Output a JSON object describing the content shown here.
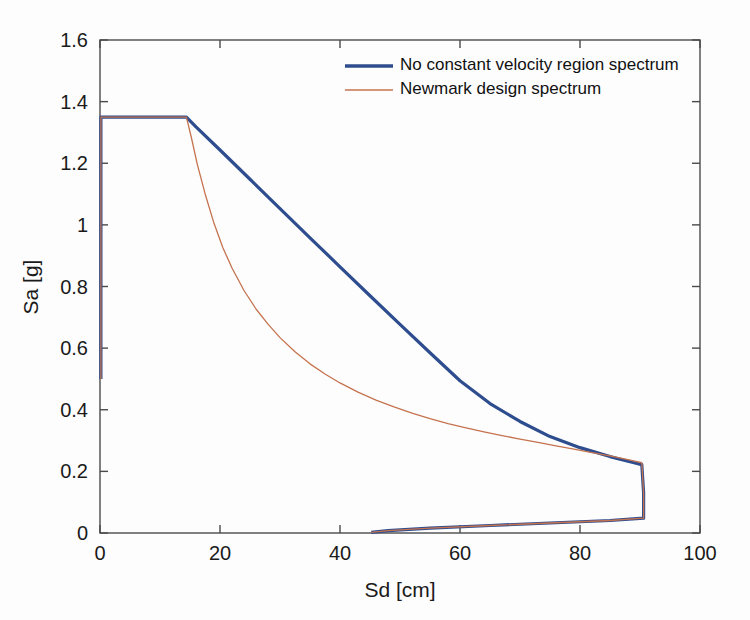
{
  "chart_data": {
    "type": "line",
    "title": "",
    "xlabel": "Sd [cm]",
    "ylabel": "Sa [g]",
    "xlim": [
      0,
      100
    ],
    "ylim": [
      0,
      1.6
    ],
    "xticks": [
      0,
      20,
      40,
      60,
      80,
      100
    ],
    "yticks": [
      0,
      0.2,
      0.4,
      0.6,
      0.8,
      1,
      1.2,
      1.4,
      1.6
    ],
    "xtick_labels": [
      "0",
      "20",
      "40",
      "60",
      "80",
      "100"
    ],
    "ytick_labels": [
      "0",
      "0.2",
      "0.4",
      "0.6",
      "0.8",
      "1",
      "1.2",
      "1.4",
      "1.6"
    ],
    "grid": false,
    "legend_position": "top-center",
    "series": [
      {
        "name": "No constant velocity region spectrum",
        "color": "#2e4d8e",
        "linewidth": 3.2,
        "points": [
          [
            0.15,
            0.5
          ],
          [
            0.15,
            1.35
          ],
          [
            2.0,
            1.35
          ],
          [
            6.0,
            1.35
          ],
          [
            10.0,
            1.35
          ],
          [
            14.4,
            1.35
          ],
          [
            16.0,
            1.318
          ],
          [
            20.0,
            1.243
          ],
          [
            25.0,
            1.148
          ],
          [
            30.0,
            1.053
          ],
          [
            35.0,
            0.958
          ],
          [
            40.0,
            0.864
          ],
          [
            45.0,
            0.77
          ],
          [
            50.0,
            0.677
          ],
          [
            55.0,
            0.585
          ],
          [
            60.0,
            0.494
          ],
          [
            65.0,
            0.42
          ],
          [
            70.0,
            0.362
          ],
          [
            75.0,
            0.313
          ],
          [
            80.0,
            0.277
          ],
          [
            85.0,
            0.248
          ],
          [
            89.0,
            0.228
          ],
          [
            90.3,
            0.222
          ],
          [
            90.6,
            0.13
          ],
          [
            90.6,
            0.048
          ],
          [
            85.0,
            0.0405
          ],
          [
            75.0,
            0.0325
          ],
          [
            65.0,
            0.0243
          ],
          [
            55.0,
            0.0155
          ],
          [
            48.0,
            0.0075
          ],
          [
            45.2,
            0.002
          ]
        ]
      },
      {
        "name": "Newmark design spectrum",
        "color": "#c5734f",
        "linewidth": 1.3,
        "points": [
          [
            0.15,
            0.5
          ],
          [
            0.15,
            1.35
          ],
          [
            2.0,
            1.35
          ],
          [
            6.0,
            1.35
          ],
          [
            10.0,
            1.35
          ],
          [
            14.4,
            1.35
          ],
          [
            15.2,
            1.286
          ],
          [
            16.2,
            1.198
          ],
          [
            17.5,
            1.102
          ],
          [
            19.0,
            1.005
          ],
          [
            20.5,
            0.925
          ],
          [
            22.0,
            0.86
          ],
          [
            24.0,
            0.787
          ],
          [
            26.0,
            0.727
          ],
          [
            28.0,
            0.678
          ],
          [
            30.0,
            0.634
          ],
          [
            32.5,
            0.588
          ],
          [
            35.0,
            0.549
          ],
          [
            37.5,
            0.516
          ],
          [
            40.0,
            0.487
          ],
          [
            43.0,
            0.457
          ],
          [
            46.0,
            0.431
          ],
          [
            49.0,
            0.409
          ],
          [
            52.0,
            0.389
          ],
          [
            55.0,
            0.371
          ],
          [
            58.0,
            0.355
          ],
          [
            61.0,
            0.341
          ],
          [
            64.0,
            0.328
          ],
          [
            67.0,
            0.316
          ],
          [
            70.0,
            0.305
          ],
          [
            73.0,
            0.294
          ],
          [
            76.0,
            0.283
          ],
          [
            79.0,
            0.272
          ],
          [
            82.0,
            0.261
          ],
          [
            85.0,
            0.25
          ],
          [
            88.0,
            0.238
          ],
          [
            90.3,
            0.228
          ],
          [
            90.6,
            0.13
          ],
          [
            90.6,
            0.048
          ],
          [
            85.0,
            0.0405
          ],
          [
            75.0,
            0.0325
          ],
          [
            65.0,
            0.0243
          ],
          [
            55.0,
            0.0155
          ],
          [
            48.0,
            0.0075
          ],
          [
            45.2,
            0.002
          ]
        ]
      }
    ]
  },
  "legend": {
    "entries": [
      {
        "label": "No constant velocity region spectrum",
        "color": "#2e4d8e",
        "linewidth": 3.4
      },
      {
        "label": "Newmark design spectrum",
        "color": "#c5734f",
        "linewidth": 1.5
      }
    ]
  },
  "axes": {
    "x_title": "Sd [cm]",
    "y_title": "Sa [g]"
  },
  "colors": {
    "background": "#fdfdfd",
    "axis": "#4a4a4a",
    "text": "#1a1a1a",
    "series_blue": "#2e4d8e",
    "series_orange": "#c5734f"
  }
}
